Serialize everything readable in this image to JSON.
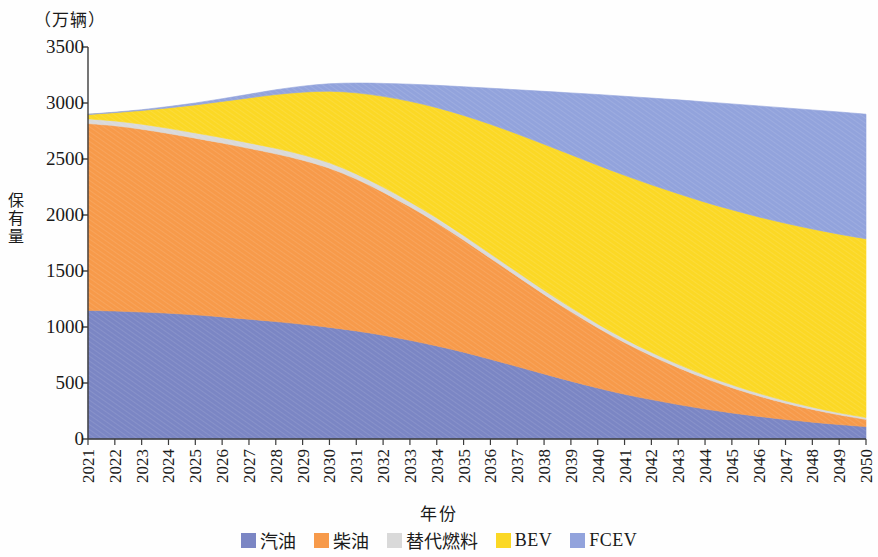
{
  "chart_data": {
    "type": "area",
    "stacked": true,
    "title": "",
    "unit_label": "（万辆）",
    "xlabel": "年份",
    "ylabel": "保有量",
    "ylim": [
      0,
      3500
    ],
    "yticks": [
      0,
      500,
      1000,
      1500,
      2000,
      2500,
      3000,
      3500
    ],
    "grid": false,
    "legend_position": "bottom",
    "categories": [
      "2021",
      "2022",
      "2023",
      "2024",
      "2025",
      "2026",
      "2027",
      "2028",
      "2029",
      "2030",
      "2031",
      "2032",
      "2033",
      "2034",
      "2035",
      "2036",
      "2037",
      "2038",
      "2039",
      "2040",
      "2041",
      "2042",
      "2043",
      "2044",
      "2045",
      "2046",
      "2047",
      "2048",
      "2049",
      "2050"
    ],
    "series": [
      {
        "name": "汽油",
        "color": "#7b86c4",
        "values": [
          1150,
          1155,
          1160,
          1168,
          1175,
          1180,
          1185,
          1190,
          1192,
          1185,
          1160,
          1120,
          1065,
          1000,
          925,
          840,
          755,
          670,
          590,
          515,
          450,
          395,
          345,
          300,
          262,
          228,
          198,
          172,
          148,
          128
        ]
      },
      {
        "name": "柴油",
        "color": "#f79a4a",
        "values": [
          1670,
          1672,
          1670,
          1668,
          1672,
          1680,
          1690,
          1700,
          1705,
          1690,
          1630,
          1545,
          1440,
          1325,
          1195,
          1065,
          940,
          820,
          710,
          610,
          520,
          440,
          370,
          308,
          254,
          206,
          165,
          130,
          100,
          75
        ]
      },
      {
        "name": "替代燃料",
        "color": "#d9d9d9",
        "values": [
          42,
          44,
          46,
          48,
          50,
          52,
          54,
          56,
          57,
          57,
          56,
          55,
          53,
          51,
          49,
          47,
          45,
          43,
          41,
          39,
          37,
          35,
          33,
          31,
          29,
          27,
          25,
          23,
          21,
          20
        ]
      },
      {
        "name": "BEV",
        "color": "#fbd825",
        "values": [
          40,
          75,
          125,
          190,
          265,
          350,
          445,
          545,
          650,
          760,
          870,
          980,
          1085,
          1185,
          1280,
          1365,
          1440,
          1505,
          1560,
          1605,
          1645,
          1680,
          1710,
          1735,
          1760,
          1780,
          1800,
          1818,
          1835,
          1850
        ]
      },
      {
        "name": "FCEV",
        "color": "#92a3dc",
        "values": [
          2,
          4,
          7,
          12,
          18,
          26,
          36,
          48,
          62,
          80,
          105,
          140,
          185,
          240,
          305,
          380,
          460,
          545,
          630,
          715,
          795,
          870,
          940,
          1005,
          1065,
          1120,
          1170,
          1215,
          1255,
          1290
        ]
      }
    ],
    "totals": [
      2904,
      2950,
      3008,
      3086,
      3180,
      3288,
      3410,
      3539,
      3666,
      3772,
      3821,
      3840,
      3828,
      3801,
      3754,
      3697,
      3640,
      3583,
      3531,
      3484,
      3447,
      3420,
      3398,
      3379,
      3370,
      3361,
      3358,
      3358,
      3359,
      3363
    ]
  },
  "axes": {
    "y_tick_labels": [
      "3500",
      "3000",
      "2500",
      "2000",
      "1500",
      "1000",
      "500",
      "0"
    ],
    "x_tick_labels": [
      "2021",
      "2022",
      "2023",
      "2024",
      "2025",
      "2026",
      "2027",
      "2028",
      "2029",
      "2030",
      "2031",
      "2032",
      "2033",
      "2034",
      "2035",
      "2036",
      "2037",
      "2038",
      "2039",
      "2040",
      "2041",
      "2042",
      "2043",
      "2044",
      "2045",
      "2046",
      "2047",
      "2048",
      "2049",
      "2050"
    ],
    "y_title": "保有量",
    "x_title": "年份",
    "unit": "（万辆）"
  },
  "legend": {
    "items": [
      {
        "label": "汽油",
        "color": "#7b86c4",
        "latin": false
      },
      {
        "label": "柴油",
        "color": "#f79a4a",
        "latin": false
      },
      {
        "label": "替代燃料",
        "color": "#d9d9d9",
        "latin": false
      },
      {
        "label": "BEV",
        "color": "#fbd825",
        "latin": true
      },
      {
        "label": "FCEV",
        "color": "#92a3dc",
        "latin": true
      }
    ]
  }
}
